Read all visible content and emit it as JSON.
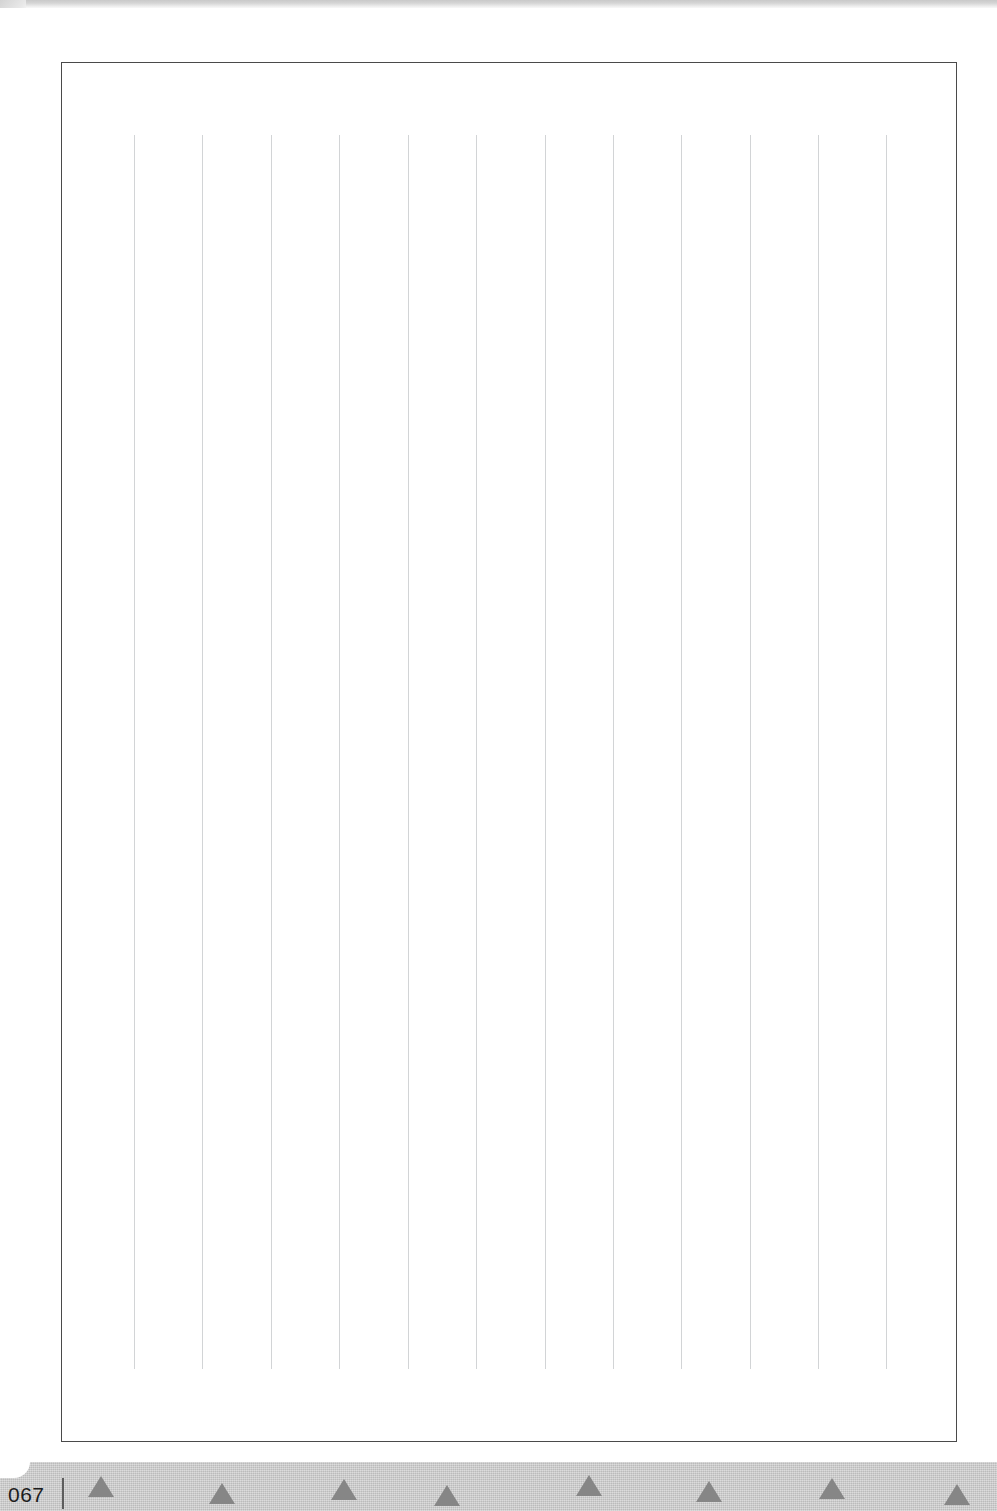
{
  "document": {
    "kind": "scanned-ruled-notebook-page",
    "page_number": "067",
    "page_number_separator": "|",
    "body_text": "",
    "sheet": {
      "background_color": "#ffffff",
      "width": 997,
      "height": 1454
    },
    "frame": {
      "border_color": "#4a4a4a",
      "left": 61,
      "top": 54,
      "width": 896,
      "height": 1380
    },
    "ruling": {
      "orientation": "vertical",
      "line_color": "#d2d4d6",
      "line_count": 12,
      "spacing_px": 68.3,
      "first_x": 134,
      "top_y": 127,
      "length_px": 1234,
      "x_positions": [
        134,
        202,
        271,
        339,
        408,
        476,
        545,
        613,
        681,
        750,
        818,
        886
      ]
    },
    "previous_page_edge": {
      "color": "#c9c9c9",
      "height": 9
    }
  },
  "footer": {
    "background_color": "#c8c8c8",
    "height": 49,
    "page_number_color": "#1d1d1d",
    "separator_color": "#5d5d5d",
    "triangle_color": "#868686",
    "triangle_label": "triangle-ornament",
    "triangles": [
      {
        "x": 88,
        "y": 14
      },
      {
        "x": 209,
        "y": 21
      },
      {
        "x": 331,
        "y": 17
      },
      {
        "x": 434,
        "y": 23
      },
      {
        "x": 576,
        "y": 13
      },
      {
        "x": 696,
        "y": 19
      },
      {
        "x": 819,
        "y": 16
      },
      {
        "x": 944,
        "y": 22
      }
    ]
  }
}
